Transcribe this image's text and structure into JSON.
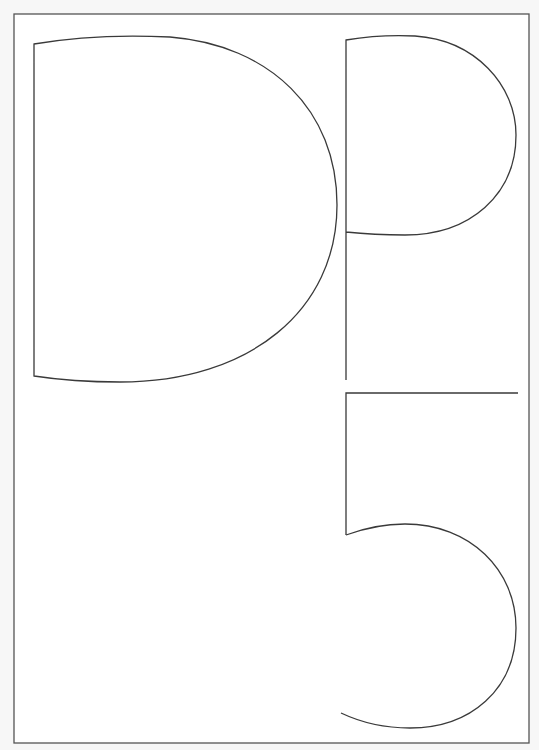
{
  "artwork": {
    "title": "DP5",
    "description": "Outlined letterforms D, P and 5 inside a rectangular frame",
    "letters": [
      "D",
      "P",
      "5"
    ],
    "colors": {
      "background": "#f7f7f7",
      "paper": "#ffffff",
      "stroke": "#3a3a3a",
      "frame": "#555555"
    }
  }
}
